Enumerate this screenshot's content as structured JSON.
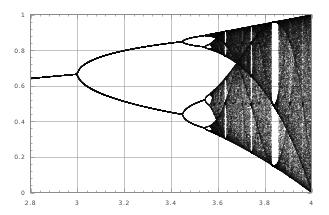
{
  "figure": {
    "type": "bifurcation-diagram",
    "background_color": "#ffffff",
    "frame_color": "#8c8c8c",
    "grid_color": "#9a9a9a",
    "point_color": "#1a1a1a",
    "tick_label_color": "#4a4a4a"
  },
  "chart_data": {
    "type": "scatter",
    "title": "",
    "subtitle": "",
    "xlabel": "",
    "ylabel": "",
    "xlim": [
      2.8,
      4.0
    ],
    "ylim": [
      0.0,
      1.0
    ],
    "grid": true,
    "legend": "none",
    "equation": "x_{n+1} = r * x_n * (1 - x_n)",
    "x_ticks": [
      2.8,
      3.0,
      3.2,
      3.4,
      3.6,
      3.8,
      4.0
    ],
    "x_tick_labels": [
      "2.8",
      "3",
      "3.2",
      "3.4",
      "3.6",
      "3.8",
      "4"
    ],
    "y_ticks": [
      0.0,
      0.2,
      0.4,
      0.6,
      0.8,
      1.0
    ],
    "y_tick_labels": [
      "0",
      "0.2",
      "0.4",
      "0.6",
      "0.8",
      "1"
    ],
    "x_minor_ticks_per_interval": 4,
    "y_minor_ticks_per_interval": 4,
    "r_start": 2.8,
    "r_end": 4.0,
    "r_steps": 1400,
    "iterations_transient": 300,
    "iterations_plotted": 220,
    "x_seed": 0.35,
    "features": {
      "fixed_point_value_at_r_2_8": 0.643,
      "first_bifurcation_r": 3.0,
      "first_bifurcation_value": 0.667,
      "second_bifurcation_r": 3.449,
      "second_bifurcation_upper": 0.84,
      "second_bifurcation_lower": 0.44,
      "third_bifurcation_r": 3.544,
      "chaos_onset_r": 3.5699,
      "period_3_window_r": 3.8284,
      "period_3_window_end_r": 3.8415,
      "period_5_window_r": 3.7382,
      "period_6_window_r": 3.6265,
      "upper_envelope_at_r_4": 1.0,
      "lower_envelope_at_r_4": 0.0
    }
  },
  "y_axis_labels": [
    {
      "text": "1",
      "value": 1.0
    },
    {
      "text": "0.8",
      "value": 0.8
    },
    {
      "text": "0.6",
      "value": 0.6
    },
    {
      "text": "0.4",
      "value": 0.4
    },
    {
      "text": "0.2",
      "value": 0.2
    },
    {
      "text": "0",
      "value": 0.0
    }
  ],
  "x_axis_labels": [
    {
      "text": "2.8",
      "value": 2.8
    },
    {
      "text": "3",
      "value": 3.0
    },
    {
      "text": "3.2",
      "value": 3.2
    },
    {
      "text": "3.4",
      "value": 3.4
    },
    {
      "text": "3.6",
      "value": 3.6
    },
    {
      "text": "3.8",
      "value": 3.8
    },
    {
      "text": "4",
      "value": 4.0
    }
  ]
}
